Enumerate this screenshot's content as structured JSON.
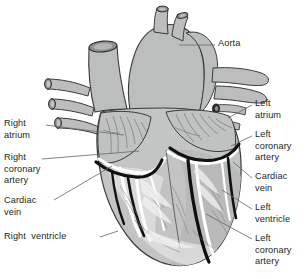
{
  "figure": {
    "view": "anterior",
    "background_color": "#ffffff",
    "muscle_fill": "#c3c4c4",
    "vessel_fill": "#bcbdbd",
    "shadow_fill": "#9b9c9c",
    "highlight_fill": "#e9eaea",
    "artery_color": "#101010",
    "vein_color": "#ffffff",
    "outline_color": "#3a3a3a",
    "leader_color": "#6d6d6d",
    "text_color": "#231f20"
  },
  "labels": {
    "aorta": {
      "text": "Aorta",
      "side": "right",
      "x": 218,
      "y": 41
    },
    "right_atrium": {
      "text": "Right\natrium",
      "side": "left",
      "x": 4,
      "y": 121
    },
    "right_coronary_artery": {
      "text": "Right\ncoronary\nartery",
      "side": "left",
      "x": 4,
      "y": 155
    },
    "cardiac_vein_left_side": {
      "text": "Cardiac\nvein",
      "side": "left",
      "x": 4,
      "y": 199
    },
    "right_ventricle": {
      "text": "Right  ventricle",
      "side": "left",
      "x": 4,
      "y": 233
    },
    "left_atrium": {
      "text": "Left\natrium",
      "side": "right",
      "x": 255,
      "y": 101
    },
    "left_coronary_artery_upper": {
      "text": "Left\ncoronary\nartery",
      "side": "right",
      "x": 255,
      "y": 131
    },
    "cardiac_vein_right_side": {
      "text": "Cardiac\nvein",
      "side": "right",
      "x": 255,
      "y": 174
    },
    "left_ventricle": {
      "text": "Left\nventricle",
      "side": "right",
      "x": 255,
      "y": 205
    },
    "left_coronary_artery_lower": {
      "text": "Left\ncoronary\nartery",
      "side": "right",
      "x": 255,
      "y": 235
    }
  },
  "structures": [
    {
      "name": "aorta",
      "type": "great-vessel"
    },
    {
      "name": "brachiocephalic-branches",
      "type": "great-vessel",
      "count": 2
    },
    {
      "name": "superior-vena-cava",
      "type": "great-vessel"
    },
    {
      "name": "pulmonary-veins-right",
      "type": "great-vessel",
      "count": 3
    },
    {
      "name": "pulmonary-artery-branches",
      "type": "great-vessel",
      "count": 2
    },
    {
      "name": "pulmonary-veins-left",
      "type": "great-vessel",
      "count": 2
    },
    {
      "name": "right-atrium",
      "type": "chamber"
    },
    {
      "name": "left-atrium",
      "type": "chamber"
    },
    {
      "name": "right-ventricle",
      "type": "chamber"
    },
    {
      "name": "left-ventricle",
      "type": "chamber"
    },
    {
      "name": "right-coronary-artery",
      "type": "artery"
    },
    {
      "name": "left-coronary-artery",
      "type": "artery"
    },
    {
      "name": "cardiac-vein",
      "type": "vein"
    }
  ]
}
